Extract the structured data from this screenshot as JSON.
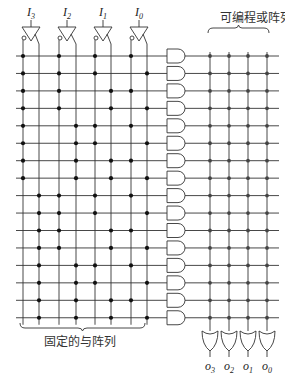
{
  "labels": {
    "programmable_or_array": "可编程或阵列",
    "fixed_and_array": "固定的与阵列"
  },
  "inputs": [
    {
      "name": "I",
      "sub": "3",
      "comp_x": 23,
      "true_x": 39,
      "buf_x": 31
    },
    {
      "name": "I",
      "sub": "2",
      "comp_x": 59,
      "true_x": 76,
      "buf_x": 67
    },
    {
      "name": "I",
      "sub": "1",
      "comp_x": 95,
      "true_x": 111,
      "buf_x": 103
    },
    {
      "name": "I",
      "sub": "0",
      "comp_x": 131,
      "true_x": 147,
      "buf_x": 139
    }
  ],
  "outputs": [
    {
      "name": "O",
      "sub": "3",
      "x": 210
    },
    {
      "name": "O",
      "sub": "2",
      "x": 229
    },
    {
      "name": "O",
      "sub": "1",
      "x": 248
    },
    {
      "name": "O",
      "sub": "0",
      "x": 267
    }
  ],
  "rows": {
    "count": 16,
    "y_start": 56,
    "spacing": 17.45,
    "minterms": [
      0,
      1,
      2,
      3,
      4,
      5,
      6,
      7,
      8,
      9,
      10,
      11,
      12,
      13,
      14,
      15
    ]
  },
  "and_array": {
    "type": "fixed",
    "line_x_start": 16,
    "line_x_end": 167,
    "dot_rule": "dot on true line when input bit = 1, else on complement line; I3 is MSB"
  },
  "and_gates": {
    "x": 167,
    "width": 18,
    "height": 14
  },
  "or_array": {
    "type": "programmable",
    "line_x_start": 185,
    "line_x_end": 279,
    "all_connected": true
  },
  "or_gates": {
    "y_top": 331,
    "height": 20,
    "width": 16
  }
}
